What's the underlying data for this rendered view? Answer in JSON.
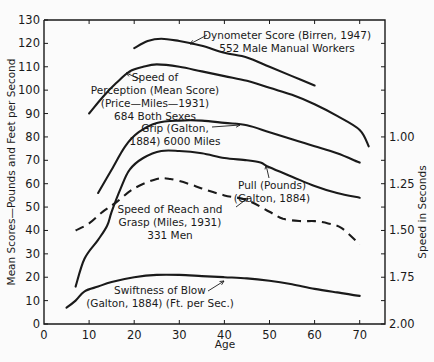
{
  "chart_data": {
    "type": "line",
    "title": "",
    "xlabel": "Age",
    "ylabel": "Mean Scores—Pounds and Feet per Second",
    "ylabel_right": "Speed in Seconds",
    "xlim": [
      0,
      75
    ],
    "ylim": [
      0,
      130
    ],
    "x_ticks": [
      0,
      10,
      20,
      30,
      40,
      50,
      60,
      70
    ],
    "y_ticks": [
      0,
      10,
      20,
      30,
      40,
      50,
      60,
      70,
      80,
      90,
      100,
      110,
      120,
      130
    ],
    "y_right_ticks": [
      {
        "label": "1.00",
        "left_equiv": 80
      },
      {
        "label": "1.25",
        "left_equiv": 60
      },
      {
        "label": "1.50",
        "left_equiv": 40
      },
      {
        "label": "1.75",
        "left_equiv": 20
      },
      {
        "label": "2.00",
        "left_equiv": 0
      }
    ],
    "y_right_minor_ticks": [
      120,
      110,
      100,
      90,
      70,
      50,
      30,
      10
    ],
    "grid": false,
    "legend": "none (curves annotated inline)",
    "series": [
      {
        "name": "Dynometer Score (Birren, 1947) 552 Male Manual Workers",
        "style": "solid",
        "x": [
          20,
          23,
          26,
          30,
          35,
          40,
          45,
          50,
          55,
          60
        ],
        "y": [
          118,
          121,
          122,
          121,
          119,
          116,
          114,
          110,
          106,
          102
        ]
      },
      {
        "name": "Speed of Perception (Mean Score) (Price—Miles—1931) 684 Both Sexes",
        "style": "solid",
        "x": [
          10,
          13,
          16,
          19,
          22,
          25,
          30,
          35,
          40,
          45,
          50,
          55,
          60,
          65,
          70,
          72
        ],
        "y": [
          90,
          97,
          103,
          108,
          110,
          111,
          110,
          108,
          106,
          104,
          101,
          98,
          94,
          89,
          83,
          76
        ]
      },
      {
        "name": "Grip (Galton, 1884) 6000 Miles",
        "style": "solid",
        "x": [
          12,
          15,
          18,
          21,
          25,
          30,
          35,
          40,
          45,
          50,
          55,
          60,
          65,
          70
        ],
        "y": [
          56,
          66,
          76,
          82,
          86,
          87,
          87,
          86,
          85,
          82,
          79,
          76,
          73,
          69
        ]
      },
      {
        "name": "Pull (Pounds) (Galton, 1884)",
        "style": "solid",
        "x": [
          7,
          9,
          12,
          14,
          15,
          17,
          19,
          22,
          26,
          30,
          35,
          40,
          45,
          48,
          50,
          55,
          60,
          65,
          70
        ],
        "y": [
          16,
          28,
          36,
          42,
          48,
          58,
          66,
          71,
          74,
          74,
          73,
          71,
          70,
          69,
          67,
          63,
          59,
          56,
          54
        ]
      },
      {
        "name": "Speed of Reach and Grasp (Miles, 1931) 331 Men",
        "style": "dashed",
        "x": [
          7,
          10,
          13,
          16,
          20,
          25,
          28,
          32,
          35,
          40,
          45,
          50,
          53,
          57,
          60,
          63,
          66,
          70
        ],
        "y": [
          40,
          43,
          48,
          52,
          58,
          62,
          62,
          60,
          58,
          55,
          53,
          48,
          45,
          44,
          44,
          43,
          41,
          34
        ]
      },
      {
        "name": "Swiftness of Blow (Galton, 1884) (Ft. per Sec.)",
        "style": "solid",
        "x": [
          5,
          7,
          9,
          12,
          15,
          20,
          25,
          30,
          35,
          40,
          45,
          50,
          55,
          60,
          65,
          70
        ],
        "y": [
          7,
          10,
          14,
          16,
          18,
          20,
          21,
          21,
          20.5,
          20,
          19.5,
          18.5,
          17,
          15,
          13.5,
          12
        ]
      }
    ],
    "annotations": [
      {
        "lines": [
          "Dynometer Score (Birren, 1947)",
          "552 Male Manual Workers"
        ],
        "x": 287,
        "y": 39,
        "anchor": "middle",
        "arrow": [
          [
            207,
            35
          ],
          [
            190,
            44
          ]
        ]
      },
      {
        "lines": [
          "Speed of",
          "Perception (Mean Score)",
          "(Price—Miles—1931)",
          "684 Both Sexes"
        ],
        "x": 155,
        "y": 81,
        "anchor": "middle",
        "arrow": [
          [
            140,
            79
          ],
          [
            126,
            73
          ]
        ]
      },
      {
        "lines": [
          "Grip (Galton,",
          "1884)  6000 Miles"
        ],
        "x": 175,
        "y": 132,
        "anchor": "middle",
        "arrow": [
          [
            212,
            127
          ],
          [
            240,
            125
          ]
        ]
      },
      {
        "lines": [
          "Pull  (Pounds)",
          "(Galton, 1884)"
        ],
        "x": 272,
        "y": 189,
        "anchor": "middle",
        "arrow": [
          [
            269,
            178
          ],
          [
            266,
            165
          ]
        ]
      },
      {
        "lines": [
          "Speed of Reach and",
          "Grasp  (Miles, 1931)",
          "331 Men"
        ],
        "x": 170,
        "y": 213,
        "anchor": "middle",
        "arrow": [
          [
            236,
            207
          ],
          [
            248,
            198
          ]
        ]
      },
      {
        "lines": [
          "Swiftness of Blow",
          "(Galton, 1884)  (Ft. per Sec.)"
        ],
        "x": 160,
        "y": 294,
        "anchor": "middle",
        "arrow": [
          [
            208,
            291
          ],
          [
            224,
            281
          ]
        ]
      }
    ]
  },
  "colors": {
    "background": "#fbfbfb",
    "ink": "#1a1a1a"
  }
}
